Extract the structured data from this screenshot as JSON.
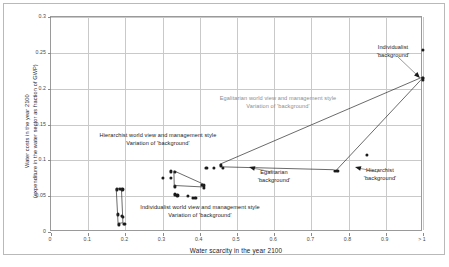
{
  "chart_data": {
    "type": "scatter",
    "title": "",
    "xlabel": "Water scarcity in the year 2100",
    "ylabel": "Water costs in the year 2100 (expenditure in the water sector as fraction of GWP)",
    "ylabel_line1": "Water costs in the year 2100",
    "ylabel_line2": "(expenditure in the water sector as fraction of GWP)",
    "xlim": [
      0,
      1.0
    ],
    "ylim": [
      0,
      0.3
    ],
    "grid": true,
    "legend": "none",
    "xticks": [
      "0",
      "0.1",
      "0.2",
      "0.3",
      "0.4",
      "0.5",
      "0.6",
      "0.7",
      "0.8",
      "0.9",
      "> 1"
    ],
    "xtick_values": [
      0,
      0.1,
      0.2,
      0.3,
      0.4,
      0.5,
      0.6,
      0.7,
      0.8,
      0.9,
      1.0
    ],
    "yticks": [
      "0",
      "0.05",
      "0.1",
      "0.15",
      "0.2",
      "0.25",
      "0.3"
    ],
    "ytick_values": [
      0,
      0.05,
      0.1,
      0.15,
      0.2,
      0.25,
      0.3
    ],
    "series": [
      {
        "name": "Individualist world view and management style",
        "points": [
          {
            "x": 0.178,
            "y": 0.0595
          },
          {
            "x": 0.186,
            "y": 0.06
          },
          {
            "x": 0.192,
            "y": 0.0595
          },
          {
            "x": 0.179,
            "y": 0.0245
          },
          {
            "x": 0.19,
            "y": 0.0225
          },
          {
            "x": 0.194,
            "y": 0.0215
          },
          {
            "x": 0.183,
            "y": 0.0105
          },
          {
            "x": 0.196,
            "y": 0.0115
          },
          {
            "x": 0.199,
            "y": 0.0118
          }
        ]
      },
      {
        "name": "Hierarchist world view and management style",
        "points": [
          {
            "x": 0.3,
            "y": 0.0755
          },
          {
            "x": 0.323,
            "y": 0.0755
          },
          {
            "x": 0.323,
            "y": 0.0845
          },
          {
            "x": 0.333,
            "y": 0.084
          },
          {
            "x": 0.334,
            "y": 0.0635
          },
          {
            "x": 0.406,
            "y": 0.0655
          },
          {
            "x": 0.412,
            "y": 0.065
          },
          {
            "x": 0.41,
            "y": 0.0615
          },
          {
            "x": 0.332,
            "y": 0.0525
          },
          {
            "x": 0.34,
            "y": 0.051
          },
          {
            "x": 0.368,
            "y": 0.0505
          },
          {
            "x": 0.382,
            "y": 0.0475
          },
          {
            "x": 0.388,
            "y": 0.0475
          }
        ]
      },
      {
        "name": "Egalitarian world view and management style",
        "points": [
          {
            "x": 0.418,
            "y": 0.09
          },
          {
            "x": 0.437,
            "y": 0.09
          },
          {
            "x": 0.456,
            "y": 0.093
          },
          {
            "x": 0.462,
            "y": 0.0895
          },
          {
            "x": 0.763,
            "y": 0.0855
          },
          {
            "x": 0.77,
            "y": 0.085
          },
          {
            "x": 0.85,
            "y": 0.108
          },
          {
            "x": 1.0,
            "y": 0.2155
          },
          {
            "x": 1.0,
            "y": 0.2145
          },
          {
            "x": 1.0,
            "y": 0.2125
          },
          {
            "x": 1.0,
            "y": 0.2545
          }
        ]
      }
    ],
    "annotations": [
      {
        "id": "hierarchist-worldview-label",
        "line1": "Hierarchist world view and management style",
        "line2": "Variation of 'background'",
        "color": "#1a1a1a"
      },
      {
        "id": "individualist-worldview-label",
        "line1": "Individualist world view and management style",
        "line2": "Variation of 'background'",
        "color": "#1a1a1a"
      },
      {
        "id": "egalitarian-worldview-label",
        "line1": "Egalitarian world view and management style",
        "line2": "Variation of 'background'",
        "color": "#8d8d8d"
      },
      {
        "id": "individualist-background-label",
        "line1": "Individualist",
        "line2": "'background'",
        "color": "#1a1a1a"
      },
      {
        "id": "egalitarian-background-label",
        "line1": "Egalitarian",
        "line2": "'background'",
        "color": "#1a1a1a"
      },
      {
        "id": "hierarchist-background-label",
        "line1": "Hierarchist",
        "line2": "'background'",
        "color": "#1a1a1a"
      }
    ]
  },
  "axes": {
    "x_title": "Water scarcity in the year 2100",
    "y_title_line1": "Water costs in the year 2100",
    "y_title_line2": "(expenditure in the water sector as fraction of GWP)"
  },
  "annot": {
    "hierarchist_worldview_l1": "Hierarchist world view and management style",
    "hierarchist_worldview_l2": "Variation of 'background'",
    "individualist_worldview_l1": "Individualist world view and management style",
    "individualist_worldview_l2": "Variation of 'background'",
    "egalitarian_worldview_l1": "Egalitarian world view and management style",
    "egalitarian_worldview_l2": "Variation of 'background'",
    "individualist_background_l1": "Individualist",
    "individualist_background_l2": "'background'",
    "egalitarian_background_l1": "Egalitarian",
    "egalitarian_background_l2": "'background'",
    "hierarchist_background_l1": "Hierarchist",
    "hierarchist_background_l2": "'background'"
  }
}
